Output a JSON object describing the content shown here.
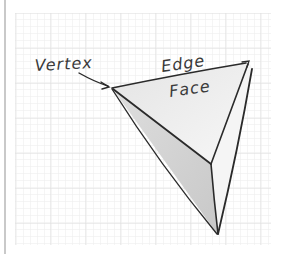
{
  "diagram": {
    "type": "polyhedron-parts-sketch",
    "labels": {
      "vertex": "Vertex",
      "edge": "Edge",
      "face": "Face"
    },
    "colors": {
      "background": "#ffffff",
      "grid_minor": "#ececec",
      "grid_major": "#dcdcdc",
      "stroke": "#2a2a2a",
      "face_top": "#efefef",
      "face_left": "#d2d2d2",
      "face_right": "#f4f4f4",
      "left_rule": "#c9c9c9"
    }
  }
}
